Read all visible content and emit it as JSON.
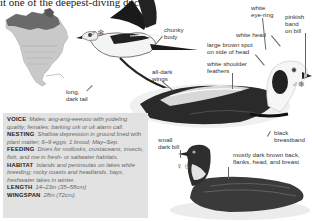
{
  "intro_text": "it one of the deepest-diving ducks.",
  "symbols": {
    "male_winter_flight": "♂❄",
    "male_winter_swim": "♂❄",
    "female_summer": "♀☼"
  },
  "labels": {
    "chunky_body": "chunky\nbody",
    "long_dark_tail": "long,\ndark tail",
    "all_dark_wings": "all-dark\nwings",
    "white_eye_ring": "white\neye-ring",
    "pinkish_band": "pinkish\nband\non bill",
    "white_head": "white head",
    "large_brown_spot": "large brown spot\non side of head",
    "white_shoulder": "white shoulder\nfeathers",
    "black_breastband": "black\nbreastband",
    "small_dark_bill": "small\ndark bill",
    "mostly_dark_brown": "mostly dark brown back,\nflanks, head, and breast"
  },
  "info": [
    {
      "key": "VOICE",
      "value": "Males: ang-ang-eeeooo with yodeling quality; females: barking urk or uk alarm call."
    },
    {
      "key": "NESTING",
      "value": "Shallow depression in ground lined with plant matter; 6–9 eggs; 1 brood; May–Sep."
    },
    {
      "key": "FEEDING",
      "value": "Dives for mollusks, crustaceans, insects, fish, and roe in fresh- or saltwater habitats."
    },
    {
      "key": "HABITAT",
      "value": "Islands and peninsulas on lakes while breeding; rocky coasts and headlands, bays, freshwater lakes in winter."
    },
    {
      "key": "LENGTH",
      "value": "14–23in (35–58cm)"
    },
    {
      "key": "WINGSPAN",
      "value": "28in (72cm)"
    }
  ],
  "colors": {
    "infobox_bg": "#e2e2e2",
    "map_land": "#c9c9c9",
    "map_range": "#6a6a6a"
  }
}
